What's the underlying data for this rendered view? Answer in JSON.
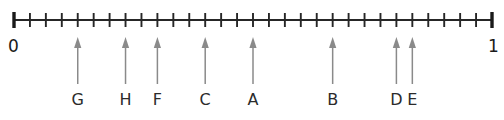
{
  "figure": {
    "type": "number-line-diagram",
    "axis": {
      "start_label": "0",
      "end_label": "1",
      "start_value": 0,
      "end_value": 1,
      "tick_count": 31,
      "interval_count": 30,
      "tick_step_fraction": "1/30",
      "line_color": "#262626",
      "tick_color": "#262626",
      "endcap_color": "#1a1a1a",
      "line_x_start_px": 14,
      "line_x_end_px": 492,
      "line_y_px": 20
    },
    "markers": [
      {
        "label": "G",
        "tick_index": 4,
        "value": 0.1333,
        "fraction": "4/30",
        "x_px": 80
      },
      {
        "label": "H",
        "tick_index": 7,
        "value": 0.2333,
        "fraction": "7/30",
        "x_px": 128
      },
      {
        "label": "F",
        "tick_index": 9,
        "value": 0.3,
        "fraction": "9/30",
        "x_px": 160
      },
      {
        "label": "C",
        "tick_index": 12,
        "value": 0.4,
        "fraction": "12/30",
        "x_px": 208
      },
      {
        "label": "A",
        "tick_index": 15,
        "value": 0.5,
        "fraction": "15/30",
        "x_px": 256
      },
      {
        "label": "B",
        "tick_index": 20,
        "value": 0.6667,
        "fraction": "20/30",
        "x_px": 336
      },
      {
        "label": "D",
        "tick_index": 24,
        "value": 0.8,
        "fraction": "24/30",
        "x_px": 400
      },
      {
        "label": "E",
        "tick_index": 25,
        "value": 0.8333,
        "fraction": "25/30",
        "x_px": 416
      }
    ],
    "arrow_color": "#8a8a8a",
    "label_color": "#2b2b2b",
    "background_color": "#ffffff"
  },
  "chart_data": {
    "type": "scatter",
    "xlabel": "",
    "ylabel": "",
    "xlim": [
      0,
      1
    ],
    "grid": false,
    "legend": "none",
    "tick_labels": [
      "0",
      "1"
    ],
    "annotations": [
      "G",
      "H",
      "F",
      "C",
      "A",
      "B",
      "D",
      "E"
    ],
    "x": [
      0.1333,
      0.2333,
      0.3,
      0.4,
      0.5,
      0.6667,
      0.8,
      0.8333
    ],
    "categories": [
      "G",
      "H",
      "F",
      "C",
      "A",
      "B",
      "D",
      "E"
    ],
    "values": [
      0.1333,
      0.2333,
      0.3,
      0.4,
      0.5,
      0.6667,
      0.8,
      0.8333
    ]
  }
}
